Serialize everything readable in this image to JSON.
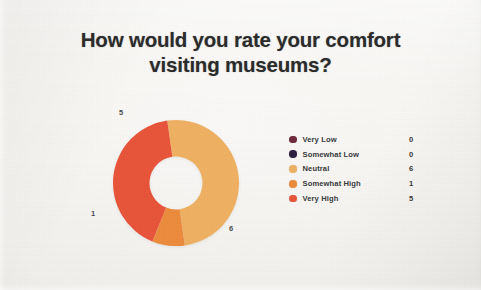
{
  "slide": {
    "background_color": "#f6f5f2",
    "title_line1": "How would you rate your comfort",
    "title_line2": "visiting museums?",
    "title_color": "#2b2b2b"
  },
  "legend": {
    "rows": [
      {
        "label": "Very Low",
        "value": "0",
        "color": "#6d2a3c"
      },
      {
        "label": "Somewhat Low",
        "value": "0",
        "color": "#2e2140"
      },
      {
        "label": "Neutral",
        "value": "6",
        "color": "#efb162"
      },
      {
        "label": "Somewhat High",
        "value": "1",
        "color": "#ec8b3c"
      },
      {
        "label": "Very High",
        "value": "5",
        "color": "#e8543a"
      }
    ]
  },
  "chart_data": {
    "type": "pie",
    "variant": "donut",
    "title": "How would you rate your comfort visiting museums?",
    "categories": [
      "Very Low",
      "Somewhat Low",
      "Neutral",
      "Somewhat High",
      "Very High"
    ],
    "values": [
      0,
      0,
      6,
      1,
      5
    ],
    "total": 12,
    "colors": [
      "#6d2a3c",
      "#2e2140",
      "#efb162",
      "#ec8b3c",
      "#e8543a"
    ],
    "hole_ratio": 0.42,
    "legend_position": "right",
    "data_labels": [
      "5",
      "1",
      "6"
    ],
    "data_label_map": {
      "Very High": "5",
      "Somewhat High": "1",
      "Neutral": "6"
    },
    "start_angle_deg": -8,
    "grid": false,
    "xlabel": "",
    "ylabel": ""
  }
}
